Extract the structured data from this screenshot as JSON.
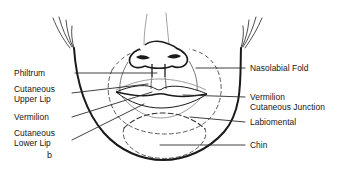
{
  "figure": {
    "panel_letter": "b",
    "caption_subject": "Topographic anatomy of the perioral region (lower face)",
    "diagram_type": "labeled anatomical line drawing",
    "view": "frontal lower-face view showing nose, lips and chin",
    "colors": {
      "background": "#ffffff",
      "ink": "#151515",
      "outline": "#1a1a1a",
      "dashed_guide": "#444444",
      "leader_line": "#2a2a2a",
      "light_detail": "#777777"
    }
  },
  "labels": {
    "left": [
      {
        "id": "philtrum",
        "text": "Philtrum",
        "lines": [
          "Philtrum"
        ]
      },
      {
        "id": "cutaneous-upper-lip",
        "text": "Cutaneous Upper Lip",
        "lines": [
          "Cutaneous",
          "Upper Lip"
        ]
      },
      {
        "id": "vermilion",
        "text": "Vermilion",
        "lines": [
          "Vermilion"
        ]
      },
      {
        "id": "cutaneous-lower-lip",
        "text": "Cutaneous Lower Lip",
        "lines": [
          "Cutaneous",
          "Lower Lip"
        ]
      }
    ],
    "right": [
      {
        "id": "nasolabial-fold",
        "text": "Nasolabial Fold",
        "lines": [
          "Nasolabial Fold"
        ]
      },
      {
        "id": "vermilion-cutaneous-junction",
        "text": "Vermilion Cutaneous Junction",
        "lines": [
          "Vermilion",
          "Cutaneous Junction"
        ]
      },
      {
        "id": "labiomental",
        "text": "Labiomental",
        "lines": [
          "Labiomental"
        ]
      },
      {
        "id": "chin",
        "text": "Chin",
        "lines": [
          "Chin"
        ]
      }
    ]
  },
  "label_text": {
    "philtrum": "Philtrum",
    "cutaneous_1": "Cutaneous",
    "upper_lip": "Upper Lip",
    "vermilion_left": "Vermilion",
    "cutaneous_2": "Cutaneous",
    "lower_lip": "Lower Lip",
    "nasolabial_fold": "Nasolabial Fold",
    "vermilion_right": "Vermilion",
    "cutaneous_junction": "Cutaneous Junction",
    "labiomental": "Labiomental",
    "chin": "Chin"
  },
  "anatomy_features": [
    "nose with alae, nostrils and columella",
    "upper and lower vermilion of the lips",
    "philtral columns",
    "dashed perioral aesthetic subunit outline",
    "dashed chin (mental) subunit outline",
    "mandibular / jaw contour",
    "sideburn and hair strokes at temples"
  ]
}
